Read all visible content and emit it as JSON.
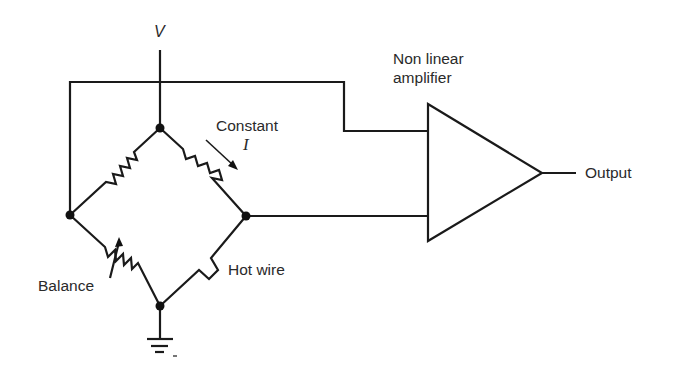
{
  "diagram": {
    "labels": {
      "supply": "V",
      "current_label": "Constant",
      "current_symbol": "I",
      "amplifier_line1": "Non linear",
      "amplifier_line2": "amplifier",
      "output": "Output",
      "balance": "Balance",
      "hot_wire": "Hot wire"
    },
    "components": [
      {
        "id": "R1",
        "type": "resistor",
        "position": "upper-left bridge arm"
      },
      {
        "id": "R2",
        "type": "resistor",
        "position": "upper-right bridge arm"
      },
      {
        "id": "R3",
        "type": "variable-resistor",
        "label": "Balance",
        "position": "lower-left bridge arm"
      },
      {
        "id": "HW",
        "type": "hot-wire-sensor",
        "label": "Hot wire",
        "position": "lower-right bridge arm"
      },
      {
        "id": "AMP",
        "type": "amplifier",
        "label": "Non linear amplifier"
      },
      {
        "id": "GND",
        "type": "ground",
        "position": "bottom node"
      }
    ],
    "nodes": [
      "top",
      "left",
      "right",
      "bottom"
    ],
    "colors": {
      "line": "#1a1a1a",
      "text": "#2a2a2a",
      "background": "#ffffff"
    }
  }
}
